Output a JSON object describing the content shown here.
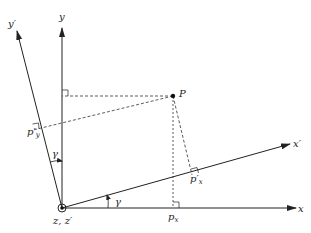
{
  "diagram": {
    "labels": {
      "y_axis": "y",
      "y_prime_axis": "y′",
      "x_axis": "x",
      "x_prime_axis": "x′",
      "point": "P",
      "origin": "z, z′",
      "angle_top": "γ",
      "angle_bottom": "γ",
      "px_main": "p",
      "px_sub": "x",
      "pxp_main": "p′",
      "pxp_sub": "x",
      "pyp_main": "p′",
      "pyp_sub": "y"
    },
    "colors": {
      "stroke": "#222222",
      "background": "#ffffff"
    }
  }
}
